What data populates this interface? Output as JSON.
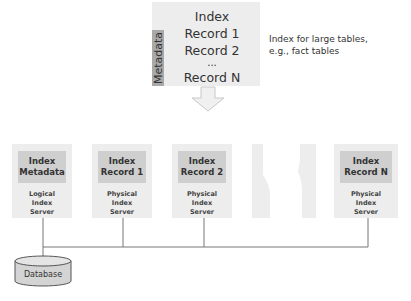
{
  "top_index": {
    "side_label": "Metadata",
    "records": [
      "Index",
      "Record 1",
      "Record 2",
      "...",
      "Record N"
    ],
    "note": [
      "Index for large tables,",
      "e.g., fact tables"
    ]
  },
  "servers": [
    {
      "title": [
        "Index",
        "Metadata"
      ],
      "caption": [
        "Logical",
        "Index",
        "Server"
      ]
    },
    {
      "title": [
        "Index",
        "Record 1"
      ],
      "caption": [
        "Physical",
        "Index",
        "Server"
      ]
    },
    {
      "title": [
        "Index",
        "Record 2"
      ],
      "caption": [
        "Physical",
        "Index",
        "Server"
      ]
    },
    {
      "title": [
        "Index",
        "Record N"
      ],
      "caption": [
        "Physical",
        "Index",
        "Server"
      ]
    }
  ],
  "database": {
    "label": "Database"
  },
  "colors": {
    "box_fill": "#ededed",
    "inner_fill": "#cfcfcf",
    "metadata_strip": "#a9a9a9",
    "line": "#666666"
  }
}
